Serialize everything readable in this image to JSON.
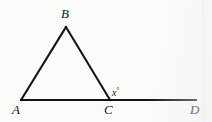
{
  "figure": {
    "kind": "geometry-diagram",
    "canvas": {
      "width": 212,
      "height": 122
    },
    "background_color": "#fbfbfa",
    "stroke_color": "#121212",
    "stroke_width": 2,
    "points": {
      "A": {
        "label": "A",
        "x": 21,
        "y": 100
      },
      "B": {
        "label": "B",
        "x": 66,
        "y": 27
      },
      "C": {
        "label": "C",
        "x": 110,
        "y": 100
      },
      "D": {
        "label": "D",
        "x": 196,
        "y": 100
      }
    },
    "segments": [
      {
        "name": "segment-AB",
        "from": "A",
        "to": "B"
      },
      {
        "name": "segment-BC",
        "from": "B",
        "to": "C"
      },
      {
        "name": "segment-AD",
        "from": "A",
        "to": "D"
      }
    ],
    "angles": [
      {
        "name": "angle-x",
        "variable": "x",
        "degree_symbol": "°",
        "at_vertex": "C",
        "between": [
          "B",
          "D"
        ]
      }
    ]
  }
}
